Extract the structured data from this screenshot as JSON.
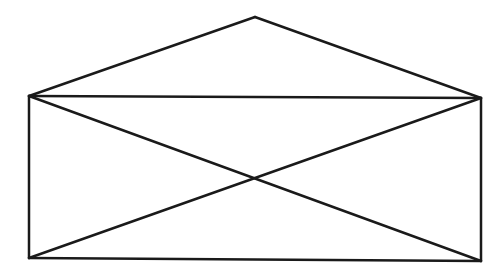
{
  "diagram": {
    "type": "line-drawing",
    "stroke_color": "#1a1a1a",
    "background_color": "#ffffff",
    "stroke_width": 2.5,
    "vertices": {
      "apex": [
        255,
        17
      ],
      "top_left": [
        29,
        96
      ],
      "top_right": [
        481,
        98
      ],
      "bottom_left": [
        29,
        258
      ],
      "bottom_right": [
        481,
        261
      ]
    },
    "segments": [
      {
        "name": "flap-left-edge",
        "from": "top_left",
        "to": "apex"
      },
      {
        "name": "flap-right-edge",
        "from": "apex",
        "to": "top_right"
      },
      {
        "name": "rect-top-edge",
        "from": "top_left",
        "to": "top_right"
      },
      {
        "name": "rect-left-edge",
        "from": "top_left",
        "to": "bottom_left"
      },
      {
        "name": "rect-right-edge",
        "from": "top_right",
        "to": "bottom_right"
      },
      {
        "name": "rect-bottom-edge",
        "from": "bottom_left",
        "to": "bottom_right"
      },
      {
        "name": "diagonal-tl-br",
        "from": "top_left",
        "to": "bottom_right"
      },
      {
        "name": "diagonal-tr-bl",
        "from": "top_right",
        "to": "bottom_left"
      }
    ]
  }
}
